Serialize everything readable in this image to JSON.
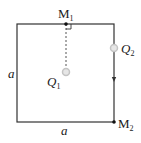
{
  "diagram": {
    "type": "square-loop-with-charges",
    "square": {
      "side_label": "a"
    },
    "labels": {
      "m1": "M",
      "m1_sub": "1",
      "m2": "M",
      "m2_sub": "2",
      "q1": "Q",
      "q1_sub": "1",
      "q2": "Q",
      "q2_sub": "2",
      "side_left": "a",
      "side_bottom": "a"
    },
    "colors": {
      "line": "#333333",
      "charge": "#cccccc",
      "text": "#1a1a1a"
    }
  }
}
